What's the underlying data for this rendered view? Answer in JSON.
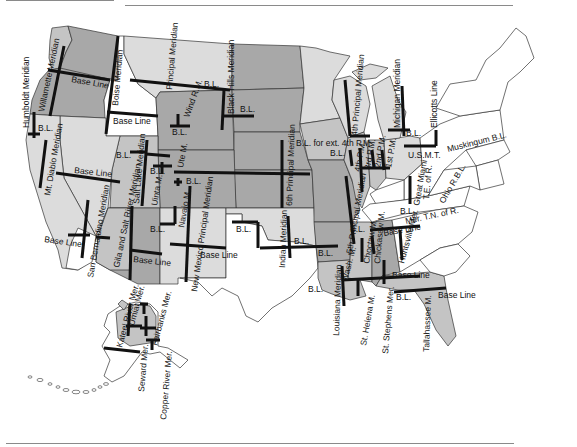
{
  "map": {
    "title": "Principal Meridians and Base Lines of the United States",
    "colors": {
      "dark_region": "#a8a8a8",
      "mid_region": "#c4c4c4",
      "light_region": "#dcdcdc",
      "unsurveyed": "#ffffff",
      "meridian_line": "#111111",
      "state_border": "#333333"
    },
    "meridians": [
      {
        "id": "humboldt",
        "label": "Humboldt Meridian"
      },
      {
        "id": "willamette",
        "label": "Willamette Meridian"
      },
      {
        "id": "boise",
        "label": "Boise Meridian"
      },
      {
        "id": "principal-mt",
        "label": "Principal Meridian"
      },
      {
        "id": "wind-river",
        "label": "Wind R.M."
      },
      {
        "id": "black-hills",
        "label": "Black Hills Meridian"
      },
      {
        "id": "mt-diablo",
        "label": "Mt. Diablo Meridian"
      },
      {
        "id": "salt-lake",
        "label": "Salt Lake Meridian"
      },
      {
        "id": "uinta",
        "label": "Uinta M."
      },
      {
        "id": "ute",
        "label": "Ute M."
      },
      {
        "id": "navajo",
        "label": "Navajo M."
      },
      {
        "id": "new-mexico",
        "label": "New Mexico Principal Meridian"
      },
      {
        "id": "san-bernardino",
        "label": "San Bernardino Meridian"
      },
      {
        "id": "gila-salt",
        "label": "Gila and Salt River Meridian"
      },
      {
        "id": "sixth-pm",
        "label": "6th Principal Meridian"
      },
      {
        "id": "indian",
        "label": "Indian Meridian"
      },
      {
        "id": "fifth-pm",
        "label": "5th Principal Meridian"
      },
      {
        "id": "fourth-pm",
        "label": "4th Principal Meridian"
      },
      {
        "id": "fourth-pm-short",
        "label": "4th P.M."
      },
      {
        "id": "third-pm",
        "label": "3rd P.M."
      },
      {
        "id": "second-pm",
        "label": "2nd P.M."
      },
      {
        "id": "first-pm",
        "label": "1st P.M."
      },
      {
        "id": "second-pm-il",
        "label": "3rd P.M."
      },
      {
        "id": "michigan",
        "label": "Michigan Meridian"
      },
      {
        "id": "ellicotts",
        "label": "Ellicotts Line"
      },
      {
        "id": "great-miami",
        "label": "Great Miami"
      },
      {
        "id": "te-of-r",
        "label": "T.E. of R."
      },
      {
        "id": "washington",
        "label": "Wash. M."
      },
      {
        "id": "choctaw",
        "label": "Choctaw M."
      },
      {
        "id": "chickasaw",
        "label": "Chickasaw M."
      },
      {
        "id": "huntsville",
        "label": "Huntsville Mer."
      },
      {
        "id": "louisiana",
        "label": "Louisiana Meridian"
      },
      {
        "id": "st-helena",
        "label": "St. Helena M."
      },
      {
        "id": "st-stephens",
        "label": "St. Stephens Mer."
      },
      {
        "id": "tallahassee",
        "label": "Tallahassee M."
      },
      {
        "id": "kateel",
        "label": "Kateel River Mer."
      },
      {
        "id": "umiat",
        "label": "Umiat Mer."
      },
      {
        "id": "fairbanks",
        "label": "Fairbanks Mer."
      },
      {
        "id": "seward",
        "label": "Seward Mer."
      },
      {
        "id": "copper-river",
        "label": "Copper River Mer."
      },
      {
        "id": "ms-principal",
        "label": "Principal Meridian"
      },
      {
        "id": "second-pm-in",
        "label": "2nd P.M."
      }
    ],
    "base_lines": [
      {
        "id": "bl-or",
        "label": "Base Line"
      },
      {
        "id": "bl-id",
        "label": "Base Line"
      },
      {
        "id": "bl-humboldt",
        "label": "B.L."
      },
      {
        "id": "bl-wind",
        "label": "B.L."
      },
      {
        "id": "bl-mt",
        "label": "B.L."
      },
      {
        "id": "bl-bh",
        "label": "B.L."
      },
      {
        "id": "bl-ca",
        "label": "Base Line"
      },
      {
        "id": "bl-sb",
        "label": "Base Line"
      },
      {
        "id": "bl-sl",
        "label": "B.L."
      },
      {
        "id": "bl-uinta",
        "label": "B.L."
      },
      {
        "id": "bl-ute",
        "label": "B.L."
      },
      {
        "id": "bl-navajo",
        "label": "B.L."
      },
      {
        "id": "bl-az",
        "label": "Base Line"
      },
      {
        "id": "bl-nm",
        "label": "Base Line"
      },
      {
        "id": "bl-tx",
        "label": "B.L."
      },
      {
        "id": "bl-ok",
        "label": "B.L."
      },
      {
        "id": "bl-ar",
        "label": "B.L."
      },
      {
        "id": "bl-ext4",
        "label": "B.L. for ext. 4th P.M."
      },
      {
        "id": "bl-4th",
        "label": "B.L."
      },
      {
        "id": "bl-il",
        "label": "B.L."
      },
      {
        "id": "bl-mi",
        "label": "B.L."
      },
      {
        "id": "bl-oh",
        "label": "B.L."
      },
      {
        "id": "bl-usmt",
        "label": "U.S.M.T."
      },
      {
        "id": "bl-muskingum",
        "label": "Muskingum B.L."
      },
      {
        "id": "bl-ohio",
        "label": "Ohio R.B.L."
      },
      {
        "id": "bl-mer-tn",
        "label": "Mer. T.N. of R."
      },
      {
        "id": "bl-tn",
        "label": "Base Line"
      },
      {
        "id": "bl-ms",
        "label": "Base Line"
      },
      {
        "id": "bl-la",
        "label": "B.L."
      },
      {
        "id": "bl-al",
        "label": "Base Line"
      },
      {
        "id": "bl-fl",
        "label": "Base Line"
      },
      {
        "id": "bl-stste",
        "label": "B.L."
      }
    ]
  }
}
